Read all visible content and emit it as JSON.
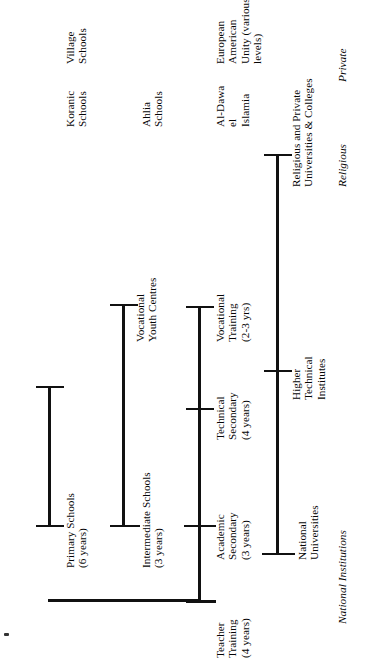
{
  "diagram": {
    "orientation": "rotated-90-ccw",
    "columns": [
      {
        "id": "national",
        "header": "National Institutions"
      },
      {
        "id": "religious",
        "header": "Religious"
      },
      {
        "id": "private",
        "header": "Private"
      }
    ],
    "nodes": {
      "national_universities": "National\nUniversities",
      "higher_technical_institutes": "Higher\nTechnical\nInstitutes",
      "academic_secondary": "Academic\nSecondary\n(3 years)",
      "technical_secondary": "Technical\nSecondary\n(4 years)",
      "vocational_training": "Vocational\nTraining\n(2-3 yrs)",
      "teacher_training": "Teacher\nTraining\n(4 years)",
      "intermediate_schools": "Intermediate Schools\n(3 years)",
      "vocational_youth_centres": "Vocational\nYouth Centres",
      "primary_schools": "Primary Schools\n(6 years)",
      "religious_private_universities": "Religious and Private\nUniversities & Colleges",
      "al_dawa_el_islamia": "Al-Dawa\nel\nIslamia",
      "ahlia_schools": "Ahlia\nSchools",
      "koranic_schools": "Koranic\nSchools",
      "european_american_unity": "European\nAmerican\nUnity (various\nlevels)",
      "village_schools": "Village\nSchools"
    },
    "colors": {
      "ink": "#111111",
      "paper": "#ffffff",
      "text": "#050505"
    }
  }
}
